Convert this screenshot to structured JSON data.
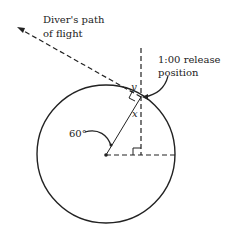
{
  "labels": {
    "path": [
      "Diver's path",
      "of flight"
    ],
    "release": [
      "1:00 release",
      "position"
    ],
    "y": "y",
    "x": "x",
    "angle": "60°"
  },
  "colors": {
    "stroke": "#222222",
    "background": "#ffffff"
  }
}
